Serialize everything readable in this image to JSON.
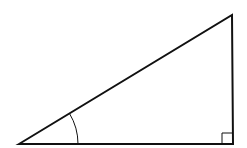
{
  "diagram": {
    "type": "right-triangle",
    "colors": {
      "background": "#ffffff",
      "stroke": "#111111"
    },
    "vertices": {
      "left": [
        19,
        144
      ],
      "top": [
        232,
        15
      ],
      "right_angle": [
        233,
        144
      ]
    },
    "angle_arc": {
      "center": [
        19,
        144
      ],
      "radius": 59,
      "label": ""
    },
    "right_angle_marker": {
      "size": 11
    }
  }
}
